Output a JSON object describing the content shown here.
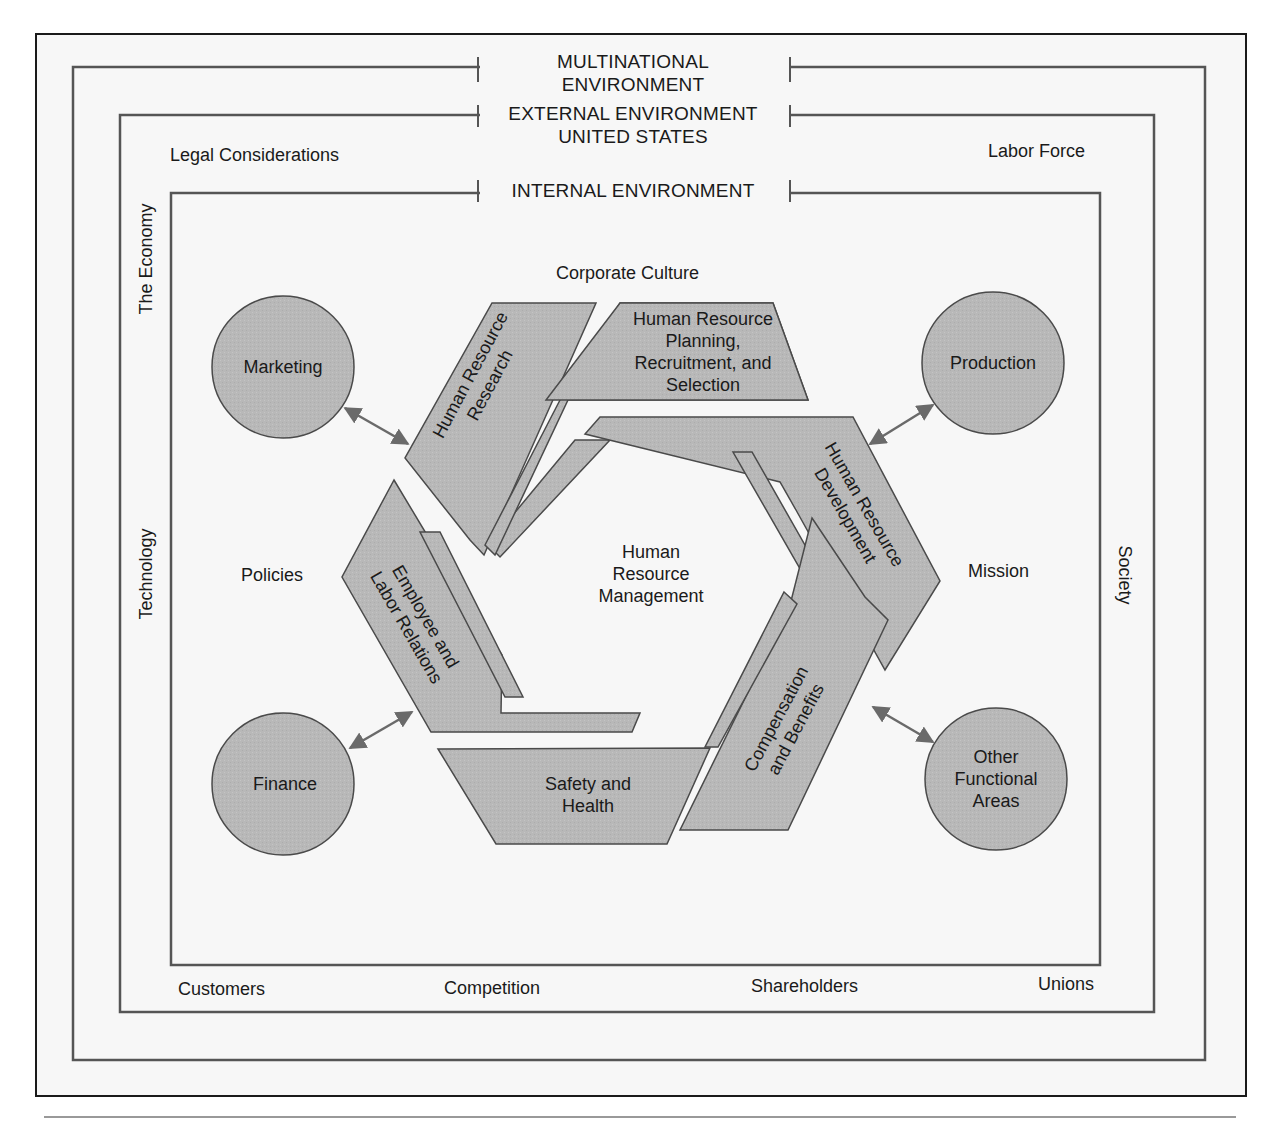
{
  "diagram": {
    "environments": {
      "multinational": {
        "line1": "MULTINATIONAL",
        "line2": "ENVIRONMENT"
      },
      "external": {
        "line1": "EXTERNAL ENVIRONMENT",
        "line2": "UNITED STATES"
      },
      "internal": {
        "line1": "INTERNAL ENVIRONMENT"
      }
    },
    "external_factors": {
      "legal": "Legal Considerations",
      "labor_force": "Labor Force",
      "economy": "The Economy",
      "technology": "Technology",
      "society": "Society",
      "customers": "Customers",
      "competition": "Competition",
      "shareholders": "Shareholders",
      "unions": "Unions"
    },
    "internal_factors": {
      "corporate_culture": "Corporate Culture",
      "policies": "Policies",
      "mission": "Mission"
    },
    "functional_areas": {
      "marketing": "Marketing",
      "production": "Production",
      "finance": "Finance",
      "other": {
        "line1": "Other",
        "line2": "Functional",
        "line3": "Areas"
      }
    },
    "hrm_core": {
      "line1": "Human",
      "line2": "Resource",
      "line3": "Management"
    },
    "hrm_functions": {
      "research": {
        "line1": "Human Resource",
        "line2": "Research"
      },
      "planning": {
        "line1": "Human Resource",
        "line2": "Planning,",
        "line3": "Recruitment, and",
        "line4": "Selection"
      },
      "development": {
        "line1": "Human Resource",
        "line2": "Development"
      },
      "compensation": {
        "line1": "Compensation",
        "line2": "and Benefits"
      },
      "safety": {
        "line1": "Safety and",
        "line2": "Health"
      },
      "employee_relations": {
        "line1": "Employee and",
        "line2": "Labor Relations"
      }
    },
    "colors": {
      "shape_fill": "#b9b9b9",
      "shape_stroke": "#4a4a4a",
      "frame_stroke": "#1a1a1a",
      "box_stroke": "#555555",
      "background": "#f7f7f7",
      "arrow": "#6a6a6a"
    }
  }
}
